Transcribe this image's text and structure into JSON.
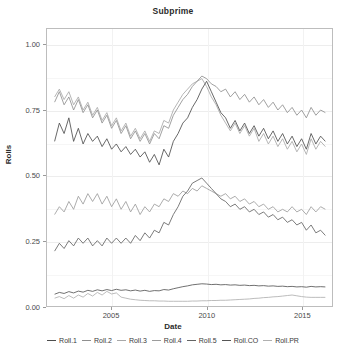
{
  "chart_data": {
    "type": "line",
    "title": "Subprime",
    "xlabel": "Date",
    "ylabel": "Rolls",
    "xlim": [
      2001.6,
      2016.6
    ],
    "ylim": [
      0.0,
      1.06
    ],
    "xticks": [
      2005,
      2010,
      2015
    ],
    "xtick_labels": [
      "2005",
      "2010",
      "2015"
    ],
    "yticks": [
      0.0,
      0.25,
      0.5,
      0.75,
      1.0
    ],
    "ytick_labels": [
      "0.00",
      "0.25",
      "0.50",
      "0.75",
      "1.00"
    ],
    "grid": true,
    "legend_position": "bottom",
    "x": [
      2002.0,
      2002.25,
      2002.5,
      2002.75,
      2003.0,
      2003.25,
      2003.5,
      2003.75,
      2004.0,
      2004.25,
      2004.5,
      2004.75,
      2005.0,
      2005.25,
      2005.5,
      2005.75,
      2006.0,
      2006.25,
      2006.5,
      2006.75,
      2007.0,
      2007.25,
      2007.5,
      2007.75,
      2008.0,
      2008.25,
      2008.5,
      2008.75,
      2009.0,
      2009.25,
      2009.5,
      2009.75,
      2010.0,
      2010.25,
      2010.5,
      2010.75,
      2011.0,
      2011.25,
      2011.5,
      2011.75,
      2012.0,
      2012.25,
      2012.5,
      2012.75,
      2013.0,
      2013.25,
      2013.5,
      2013.75,
      2014.0,
      2014.25,
      2014.5,
      2014.75,
      2015.0,
      2015.25,
      2015.5,
      2015.75,
      2016.0,
      2016.25
    ],
    "series": [
      {
        "name": "Roll.1",
        "color": "#4d4d4d",
        "values": [
          0.63,
          0.7,
          0.66,
          0.72,
          0.63,
          0.68,
          0.62,
          0.66,
          0.63,
          0.65,
          0.61,
          0.64,
          0.6,
          0.62,
          0.59,
          0.61,
          0.58,
          0.6,
          0.57,
          0.59,
          0.55,
          0.58,
          0.54,
          0.6,
          0.57,
          0.63,
          0.66,
          0.7,
          0.72,
          0.76,
          0.79,
          0.83,
          0.86,
          0.82,
          0.78,
          0.74,
          0.72,
          0.68,
          0.71,
          0.67,
          0.7,
          0.66,
          0.69,
          0.65,
          0.68,
          0.64,
          0.67,
          0.63,
          0.66,
          0.62,
          0.65,
          0.61,
          0.64,
          0.6,
          0.66,
          0.62,
          0.65,
          0.63
        ]
      },
      {
        "name": "Roll.2",
        "color": "#8f8f8f",
        "values": [
          0.78,
          0.82,
          0.77,
          0.8,
          0.75,
          0.79,
          0.74,
          0.77,
          0.72,
          0.75,
          0.7,
          0.73,
          0.68,
          0.71,
          0.66,
          0.69,
          0.64,
          0.67,
          0.63,
          0.66,
          0.62,
          0.66,
          0.64,
          0.69,
          0.68,
          0.73,
          0.76,
          0.79,
          0.81,
          0.84,
          0.86,
          0.88,
          0.87,
          0.85,
          0.84,
          0.82,
          0.83,
          0.8,
          0.82,
          0.79,
          0.81,
          0.78,
          0.8,
          0.77,
          0.79,
          0.76,
          0.78,
          0.75,
          0.77,
          0.74,
          0.76,
          0.73,
          0.75,
          0.72,
          0.76,
          0.73,
          0.75,
          0.74
        ]
      },
      {
        "name": "Roll.3",
        "color": "#a8a8a8",
        "values": [
          0.8,
          0.83,
          0.79,
          0.82,
          0.77,
          0.8,
          0.75,
          0.78,
          0.73,
          0.76,
          0.71,
          0.74,
          0.69,
          0.72,
          0.67,
          0.7,
          0.65,
          0.68,
          0.64,
          0.67,
          0.63,
          0.67,
          0.66,
          0.71,
          0.7,
          0.75,
          0.78,
          0.81,
          0.83,
          0.85,
          0.86,
          0.87,
          0.84,
          0.8,
          0.77,
          0.73,
          0.7,
          0.67,
          0.7,
          0.66,
          0.69,
          0.65,
          0.68,
          0.63,
          0.66,
          0.62,
          0.65,
          0.61,
          0.64,
          0.6,
          0.63,
          0.59,
          0.62,
          0.58,
          0.64,
          0.6,
          0.63,
          0.61
        ]
      },
      {
        "name": "Roll.4",
        "color": "#9c9c9c",
        "values": [
          0.35,
          0.38,
          0.36,
          0.4,
          0.37,
          0.42,
          0.39,
          0.43,
          0.4,
          0.43,
          0.39,
          0.42,
          0.38,
          0.41,
          0.37,
          0.4,
          0.36,
          0.39,
          0.35,
          0.38,
          0.36,
          0.39,
          0.38,
          0.41,
          0.4,
          0.43,
          0.42,
          0.44,
          0.43,
          0.45,
          0.44,
          0.46,
          0.45,
          0.44,
          0.43,
          0.42,
          0.43,
          0.41,
          0.42,
          0.4,
          0.41,
          0.39,
          0.4,
          0.38,
          0.39,
          0.37,
          0.38,
          0.36,
          0.37,
          0.36,
          0.38,
          0.36,
          0.37,
          0.35,
          0.38,
          0.36,
          0.38,
          0.37
        ]
      },
      {
        "name": "Roll.5",
        "color": "#646464",
        "values": [
          0.21,
          0.24,
          0.22,
          0.25,
          0.23,
          0.26,
          0.24,
          0.26,
          0.23,
          0.25,
          0.23,
          0.26,
          0.24,
          0.26,
          0.24,
          0.26,
          0.24,
          0.27,
          0.25,
          0.28,
          0.26,
          0.29,
          0.28,
          0.32,
          0.31,
          0.35,
          0.38,
          0.42,
          0.44,
          0.47,
          0.48,
          0.49,
          0.47,
          0.45,
          0.43,
          0.41,
          0.4,
          0.38,
          0.39,
          0.37,
          0.38,
          0.36,
          0.37,
          0.35,
          0.36,
          0.34,
          0.35,
          0.33,
          0.34,
          0.32,
          0.33,
          0.31,
          0.32,
          0.29,
          0.31,
          0.28,
          0.29,
          0.27
        ]
      },
      {
        "name": "Roll.CO",
        "color": "#555555",
        "values": [
          0.045,
          0.052,
          0.048,
          0.055,
          0.05,
          0.057,
          0.053,
          0.06,
          0.056,
          0.062,
          0.058,
          0.063,
          0.059,
          0.064,
          0.06,
          0.062,
          0.058,
          0.061,
          0.057,
          0.06,
          0.056,
          0.059,
          0.058,
          0.063,
          0.061,
          0.066,
          0.07,
          0.074,
          0.077,
          0.081,
          0.083,
          0.085,
          0.084,
          0.082,
          0.083,
          0.081,
          0.082,
          0.08,
          0.081,
          0.079,
          0.08,
          0.078,
          0.079,
          0.077,
          0.078,
          0.076,
          0.077,
          0.075,
          0.076,
          0.074,
          0.075,
          0.073,
          0.074,
          0.072,
          0.075,
          0.073,
          0.074,
          0.073
        ]
      },
      {
        "name": "Roll.PR",
        "color": "#b0b0b0",
        "values": [
          0.03,
          0.036,
          0.028,
          0.04,
          0.03,
          0.042,
          0.034,
          0.048,
          0.038,
          0.052,
          0.042,
          0.056,
          0.046,
          0.05,
          0.034,
          0.03,
          0.026,
          0.024,
          0.022,
          0.021,
          0.02,
          0.02,
          0.019,
          0.019,
          0.018,
          0.018,
          0.018,
          0.018,
          0.018,
          0.019,
          0.019,
          0.02,
          0.02,
          0.021,
          0.021,
          0.022,
          0.022,
          0.023,
          0.024,
          0.025,
          0.026,
          0.027,
          0.029,
          0.03,
          0.032,
          0.033,
          0.035,
          0.036,
          0.038,
          0.04,
          0.042,
          0.039,
          0.036,
          0.034,
          0.033,
          0.033,
          0.033,
          0.033
        ]
      }
    ]
  }
}
